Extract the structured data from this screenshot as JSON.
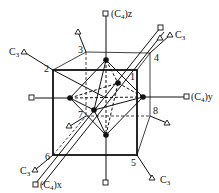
{
  "figure": {
    "corners": [
      {
        "id": "1",
        "label": "1",
        "x": 137,
        "y": 70
      },
      {
        "id": "2",
        "label": "2",
        "x": 53,
        "y": 70
      },
      {
        "id": "3",
        "label": "3",
        "x": 86,
        "y": 52
      },
      {
        "id": "4",
        "label": "4",
        "x": 150,
        "y": 53
      },
      {
        "id": "5",
        "label": "5",
        "x": 137,
        "y": 155
      },
      {
        "id": "6",
        "label": "6",
        "x": 53,
        "y": 155
      },
      {
        "id": "7",
        "label": "7",
        "x": 86,
        "y": 116
      },
      {
        "id": "8",
        "label": "8",
        "x": 150,
        "y": 116
      }
    ],
    "axes": {
      "c4z": {
        "prefix": "(C",
        "sub": "4",
        "suffix": ")z"
      },
      "c4y": {
        "prefix": "(C",
        "sub": "4",
        "suffix": ")y"
      },
      "c4x": {
        "prefix": "(C",
        "sub": "4",
        "suffix": ")x"
      },
      "c3": {
        "prefix": "C",
        "sub": "3"
      }
    }
  }
}
